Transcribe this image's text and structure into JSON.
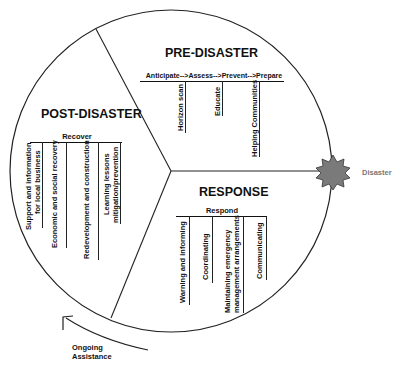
{
  "diagram": {
    "sections": {
      "pre": {
        "title": "PRE-DISASTER",
        "phase": "Anticipate-->Assess-->Prevent-->Prepare",
        "items": [
          "Horizon scan",
          "Educate",
          "Helping Communities"
        ]
      },
      "response": {
        "title": "RESPONSE",
        "phase": "Respond",
        "items": [
          "Warning and informing",
          "Coordinating",
          "Maintaining emergency",
          "management arrangements",
          "Communicating"
        ]
      },
      "post": {
        "title": "POST-DISASTER",
        "phase": "Recover",
        "items": [
          "Support and information",
          "for local business",
          "Economic and social recovery",
          "Redevelopment and construction",
          "Learning lessons",
          "mitigation/prevention"
        ]
      }
    },
    "event_label": "Disaster",
    "cycle_label_line1": "Ongoing",
    "cycle_label_line2": "Assistance",
    "colors": {
      "star": "#7a7a7a",
      "lines": "#222222",
      "event_text": "#777777"
    }
  }
}
